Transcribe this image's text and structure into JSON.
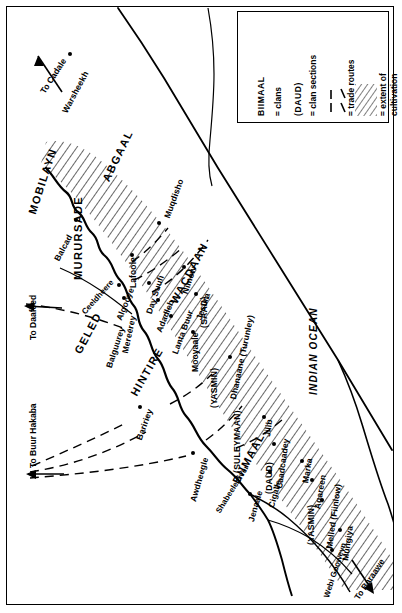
{
  "map": {
    "title": "Clan map of the Lower Shabeele region, Somalia",
    "ocean_label": "INDIAN OCEAN",
    "colors": {
      "ink": "#000000",
      "paper": "#ffffff",
      "hatch": "#333333"
    }
  },
  "legend": {
    "entries": [
      {
        "key": "BIIMAAL",
        "label": "= clans",
        "swatch": "uppercase-name"
      },
      {
        "key": "(DAUD)",
        "label": "= clan sections",
        "swatch": "paren-name"
      },
      {
        "key": "",
        "label": "= trade routes",
        "swatch": "dashed-lines"
      },
      {
        "key": "",
        "label": "= extent of cultivation",
        "swatch": "hatch-pattern"
      }
    ]
  },
  "clans": [
    {
      "name": "MOBILAYN"
    },
    {
      "name": "MURURSADE"
    },
    {
      "name": "ABGAAL"
    },
    {
      "name": "GELED"
    },
    {
      "name": "HINTIRE"
    },
    {
      "name": "WACDAAN"
    },
    {
      "name": "BIIMAAL"
    }
  ],
  "clan_sections": [
    {
      "name": "(SAAD)"
    },
    {
      "name": "(YASMIN)"
    },
    {
      "name": "(SULEYMAAN)"
    },
    {
      "name": "(DAUD)"
    },
    {
      "name": "(YASMIN)"
    }
  ],
  "settlements": [
    {
      "name": "Warsheekh"
    },
    {
      "name": "Balcad"
    },
    {
      "name": "Lafoole"
    },
    {
      "name": "Algooye"
    },
    {
      "name": "Mereerey"
    },
    {
      "name": "Balguurey"
    },
    {
      "name": "Day Suufi"
    },
    {
      "name": "Adadleh"
    },
    {
      "name": "Lanta Buur"
    },
    {
      "name": "Muqdisho"
    },
    {
      "name": "Nimow"
    },
    {
      "name": "Jesiira"
    },
    {
      "name": "Mooyaale"
    },
    {
      "name": "Dhanaane (Turunley)"
    },
    {
      "name": "Baririey"
    },
    {
      "name": "Awdheegle"
    },
    {
      "name": "Jenaale"
    },
    {
      "name": "Cigalle"
    },
    {
      "name": "Jilib"
    },
    {
      "name": "Caadcaadey"
    },
    {
      "name": "Marka"
    },
    {
      "name": "Agareen"
    },
    {
      "name": "Melled (Fiinlow)"
    },
    {
      "name": "Mungiya"
    }
  ],
  "rivers": [
    {
      "name": "Shabeele river"
    },
    {
      "name": "Ceeldheere"
    },
    {
      "name": "Webi Gooweyn"
    }
  ],
  "routes": [
    {
      "name": "To Cadale"
    },
    {
      "name": "To Daafeed"
    },
    {
      "name": "To Buur Hakaba"
    },
    {
      "name": "To Baraawe"
    }
  ]
}
